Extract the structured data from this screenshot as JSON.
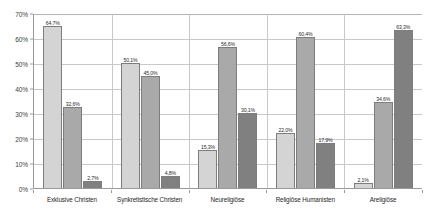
{
  "chart_data": {
    "type": "bar",
    "title": "",
    "xlabel": "",
    "ylabel": "",
    "ylim": [
      0,
      70
    ],
    "grid": true,
    "legend_position": "none",
    "y_ticks": [
      "0%",
      "10%",
      "20%",
      "30%",
      "40%",
      "50%",
      "60%",
      "70%"
    ],
    "y_tick_values": [
      0,
      10,
      20,
      30,
      40,
      50,
      60,
      70
    ],
    "categories": [
      "Exklusive Christen",
      "Synkretistische Christen",
      "Neureligiöse",
      "Religiöse Humanisten",
      "Areligiöse"
    ],
    "series": [
      {
        "name": "series-1",
        "color": "#d4d4d4",
        "values": [
          64.7,
          50.1,
          15.3,
          22.0,
          2.1
        ],
        "labels": [
          "64,7%",
          "50,1%",
          "15,3%",
          "22,0%",
          "2,1%"
        ]
      },
      {
        "name": "series-2",
        "color": "#a9a9a9",
        "values": [
          32.6,
          45.0,
          56.6,
          60.4,
          34.6
        ],
        "labels": [
          "32,6%",
          "45,0%",
          "56,6%",
          "60,4%",
          "34,6%"
        ]
      },
      {
        "name": "series-3",
        "color": "#808080",
        "values": [
          2.7,
          4.8,
          30.1,
          17.9,
          63.3
        ],
        "labels": [
          "2,7%",
          "4,8%",
          "30,1%",
          "17,9%",
          "63,3%"
        ]
      }
    ]
  }
}
